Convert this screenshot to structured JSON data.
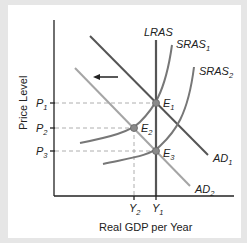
{
  "diagram": {
    "type": "AD-AS model",
    "axes": {
      "y_label": "Price Level",
      "x_label": "Real GDP per Year"
    },
    "price_ticks": [
      {
        "base": "P",
        "sub": "1"
      },
      {
        "base": "P",
        "sub": "2"
      },
      {
        "base": "P",
        "sub": "3"
      }
    ],
    "output_ticks": [
      {
        "base": "Y",
        "sub": "2"
      },
      {
        "base": "Y",
        "sub": "1"
      }
    ],
    "curves": {
      "lras": {
        "label": "LRAS"
      },
      "sras1": {
        "base": "SRAS",
        "sub": "1"
      },
      "sras2": {
        "base": "SRAS",
        "sub": "2"
      },
      "ad1": {
        "base": "AD",
        "sub": "1"
      },
      "ad2": {
        "base": "AD",
        "sub": "2"
      }
    },
    "points": [
      {
        "base": "E",
        "sub": "1"
      },
      {
        "base": "E",
        "sub": "2"
      },
      {
        "base": "E",
        "sub": "3"
      }
    ],
    "shift_arrow": "leftward shift of aggregate demand",
    "colors": {
      "dark_curve": "#555555",
      "light_curve": "#9a9a9a",
      "axis": "#222222",
      "dash": "#999999",
      "point": "#8a8a8a"
    }
  }
}
